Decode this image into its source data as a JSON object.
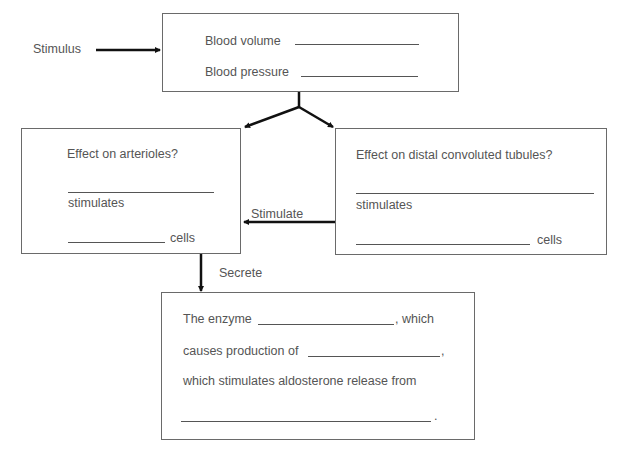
{
  "diagram": {
    "stimulus_label": "Stimulus",
    "top_box": {
      "line1": "Blood volume",
      "line2": "Blood pressure"
    },
    "left_box": {
      "question": "Effect on arterioles?",
      "stimulates": "stimulates",
      "cells": "cells"
    },
    "right_box": {
      "question": "Effect on distal convoluted tubules?",
      "stimulates": "stimulates",
      "cells": "cells"
    },
    "edge_labels": {
      "stimulate": "Stimulate",
      "secrete": "Secrete"
    },
    "bottom_box": {
      "line1_prefix": "The enzyme",
      "line1_suffix": ", which",
      "line2_prefix": "causes production of",
      "line2_suffix": ",",
      "line3": "which stimulates aldosterone release from",
      "line4_suffix": "."
    },
    "colors": {
      "line": "#111111",
      "box_border": "#6a6a6a",
      "text": "#555555"
    }
  }
}
